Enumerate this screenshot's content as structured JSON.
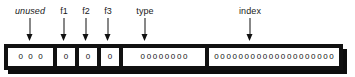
{
  "diagram": {
    "colors": {
      "border": "#111111",
      "fill": "#ffffff",
      "shadow": "#0d0d0d",
      "text": "#1a1a1a"
    },
    "fields": [
      {
        "key": "unused",
        "label": "unused",
        "label_style": "italic",
        "bits": "0 0 0",
        "bit_count": 3
      },
      {
        "key": "f1",
        "label": "f1",
        "label_style": "normal",
        "bits": "0",
        "bit_count": 1
      },
      {
        "key": "f2",
        "label": "f2",
        "label_style": "normal",
        "bits": "0",
        "bit_count": 1
      },
      {
        "key": "f3",
        "label": "f3",
        "label_style": "normal",
        "bits": "0",
        "bit_count": 1
      },
      {
        "key": "type",
        "label": "type",
        "label_style": "normal",
        "bits": "00000000",
        "bit_count": 8
      },
      {
        "key": "index",
        "label": "index",
        "label_style": "normal",
        "bits": "00000000000000000000",
        "bit_count": 20
      }
    ]
  }
}
